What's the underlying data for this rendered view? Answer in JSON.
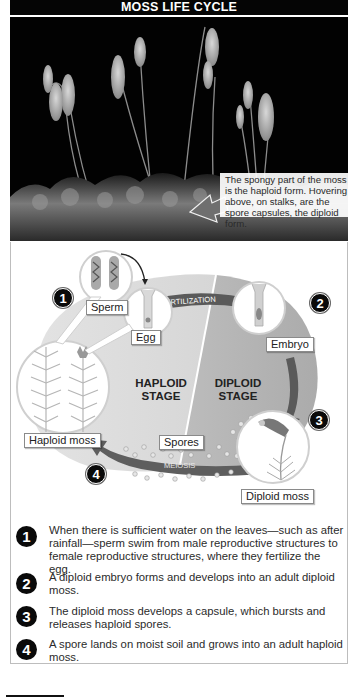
{
  "title": "MOSS LIFE CYCLE",
  "photo": {
    "caption": "The spongy part of the moss is the haploid form. Hovering above, on stalks, are the spore capsules, the diploid form."
  },
  "diagram": {
    "labels": {
      "sperm": "Sperm",
      "egg": "Egg",
      "embryo": "Embryo",
      "haploid_moss": "Haploid moss",
      "diploid_moss": "Diploid moss",
      "spores": "Spores"
    },
    "arrows": {
      "fertilization": "FERTILIZATION",
      "meiosis": "MEIOSIS"
    },
    "stages": {
      "haploid": [
        "HAPLOID",
        "STAGE"
      ],
      "diploid": [
        "DIPLOID",
        "STAGE"
      ]
    },
    "badges": [
      "1",
      "2",
      "3",
      "4"
    ],
    "colors": {
      "haploid_region": "#d9d9d9",
      "diploid_region": "#b8b8b8",
      "arrow": "#5a5a5a",
      "badge": "#0a0a0a"
    }
  },
  "steps": [
    {
      "number": "1",
      "text": "When there is sufficient water on the leaves—such as after rainfall—sperm swim from male reproductive structures to female reproductive structures, where they fertilize the egg."
    },
    {
      "number": "2",
      "text": "A diploid embryo forms and develops into an adult diploid moss."
    },
    {
      "number": "3",
      "text": "The diploid moss develops a capsule, which bursts and releases haploid spores."
    },
    {
      "number": "4",
      "text": "A spore lands on moist soil and grows into an adult haploid moss."
    }
  ]
}
